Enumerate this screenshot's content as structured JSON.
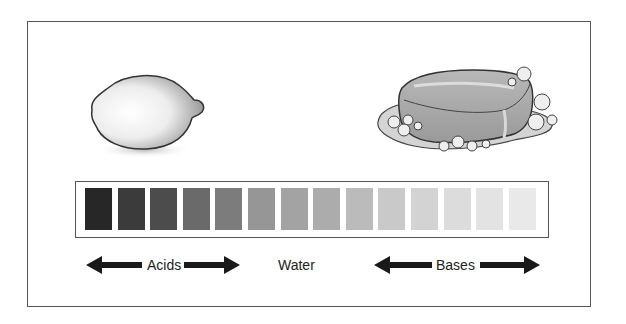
{
  "figure": {
    "acid_example": "lemon",
    "base_example": "soap bar"
  },
  "scale": {
    "swatch_count": 14,
    "swatches": [
      {
        "color": "#272727"
      },
      {
        "color": "#3b3b3b"
      },
      {
        "color": "#4c4c4c"
      },
      {
        "color": "#6a6a6a"
      },
      {
        "color": "#7c7c7c"
      },
      {
        "color": "#969696"
      },
      {
        "color": "#a3a3a3"
      },
      {
        "color": "#acacac"
      },
      {
        "color": "#bbbbbb"
      },
      {
        "color": "#c9c9c9"
      },
      {
        "color": "#d3d3d3"
      },
      {
        "color": "#dcdcdc"
      },
      {
        "color": "#e3e3e3"
      },
      {
        "color": "#e9e9e9"
      }
    ]
  },
  "labels": {
    "acids": "Acids",
    "water": "Water",
    "bases": "Bases"
  },
  "colors": {
    "frame": "#555555",
    "arrow": "#1a1a1a",
    "text": "#222222"
  }
}
